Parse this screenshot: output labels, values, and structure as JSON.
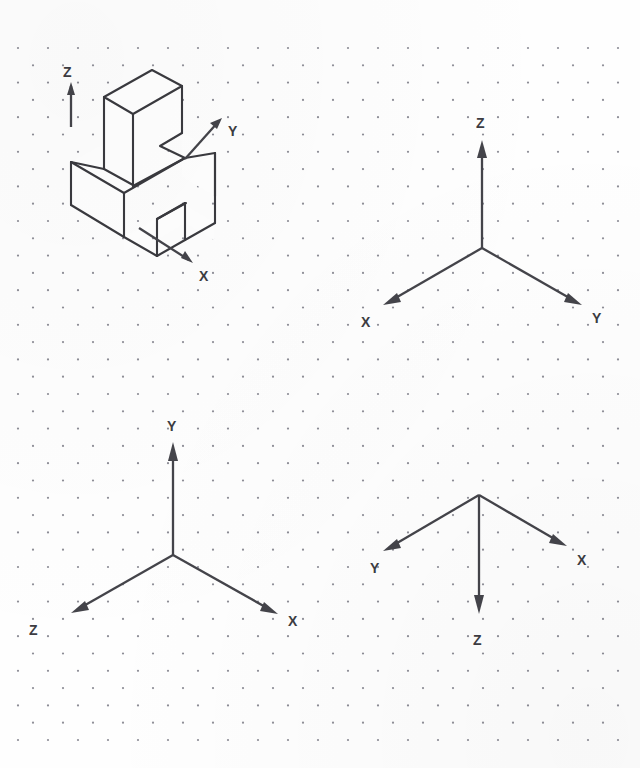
{
  "sheet": {
    "width": 640,
    "height": 768,
    "background_color": "#fefefe",
    "paper_type": "isometric-dot-grid",
    "ink_color": "#3a3a3f",
    "dot_color": "#8d8d96"
  },
  "grid": {
    "label": "Isometric dot grid",
    "dot_spacing_x": 30,
    "dot_row_spacing_y": 17.3,
    "dot_radius": 1.1,
    "origin_x": 18,
    "origin_y": 48,
    "columns": 21,
    "rows": 41
  },
  "figures": [
    {
      "id": "isometric-object",
      "name": "isometric-solid-figure",
      "description": "Isometric pictorial of a machined block with an upright angled rib and a rectangular notch in the base",
      "axes": [
        {
          "name": "Z",
          "label": "Z",
          "direction": "up",
          "label_x": 68,
          "label_y": 75
        },
        {
          "name": "Y",
          "label": "Y",
          "direction": "upper-right",
          "label_x": 225,
          "label_y": 132
        },
        {
          "name": "X",
          "label": "X",
          "direction": "lower-right",
          "label_x": 201,
          "label_y": 277
        }
      ]
    },
    {
      "id": "triad-top-right",
      "name": "axis-triad-z-up",
      "description": "Coordinate triad with Z vertical up, X to the lower left, Y to the lower right",
      "origin_x": 482,
      "origin_y": 248,
      "axes": [
        {
          "name": "Z",
          "label": "Z",
          "direction": "up",
          "label_x": 477,
          "label_y": 128
        },
        {
          "name": "X",
          "label": "X",
          "direction": "lower-left",
          "label_x": 362,
          "label_y": 325
        },
        {
          "name": "Y",
          "label": "Y",
          "direction": "lower-right",
          "label_x": 594,
          "label_y": 322
        }
      ]
    },
    {
      "id": "triad-bottom-left",
      "name": "axis-triad-y-up",
      "description": "Coordinate triad with Y vertical up, Z to the lower left, X to the lower right",
      "origin_x": 173,
      "origin_y": 555,
      "axes": [
        {
          "name": "Y",
          "label": "Y",
          "direction": "up",
          "label_x": 169,
          "label_y": 428
        },
        {
          "name": "Z",
          "label": "Z",
          "direction": "lower-left",
          "label_x": 31,
          "label_y": 632
        },
        {
          "name": "X",
          "label": "X",
          "direction": "lower-right",
          "label_x": 290,
          "label_y": 624
        }
      ]
    },
    {
      "id": "triad-bottom-right",
      "name": "axis-triad-z-down",
      "description": "Coordinate triad with Z vertical down, Y to the upper left, X to the upper right",
      "origin_x": 479,
      "origin_y": 495,
      "axes": [
        {
          "name": "Z",
          "label": "Z",
          "direction": "down",
          "label_x": 475,
          "label_y": 641
        },
        {
          "name": "Y",
          "label": "Y",
          "direction": "upper-left",
          "label_x": 372,
          "label_y": 570
        },
        {
          "name": "X",
          "label": "X",
          "direction": "upper-right",
          "label_x": 579,
          "label_y": 562
        }
      ]
    }
  ],
  "labels": {
    "x": "X",
    "y": "Y",
    "z": "Z"
  }
}
